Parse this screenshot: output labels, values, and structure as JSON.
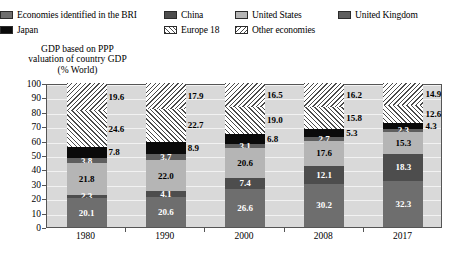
{
  "legend": {
    "rows": [
      [
        {
          "label": "Economies identified in the BRI",
          "key": "bri"
        },
        {
          "label": "China",
          "key": "china"
        },
        {
          "label": "United States",
          "key": "us"
        },
        {
          "label": "United Kingdom",
          "key": "uk"
        }
      ],
      [
        {
          "label": "Japan",
          "key": "japan"
        },
        {
          "label": "Europe 18",
          "key": "eu18"
        },
        {
          "label": "Other economies",
          "key": "other"
        }
      ]
    ]
  },
  "axis_title": {
    "line1": "GDP based on PPP",
    "line2": "valuation of country GDP",
    "line3": "(% World)"
  },
  "chart_data": {
    "type": "bar",
    "title": "GDP based on PPP valuation of country GDP (% World)",
    "xlabel": "",
    "ylabel": "% World",
    "ylim": [
      0,
      100
    ],
    "yticks": [
      0,
      10,
      20,
      30,
      40,
      50,
      60,
      70,
      80,
      90,
      100
    ],
    "grid": true,
    "stacked": true,
    "legend_position": "top",
    "categories": [
      "1980",
      "1990",
      "2000",
      "2008",
      "2017"
    ],
    "series": [
      {
        "name": "Economies identified in the BRI",
        "key": "bri",
        "color": "#6e6e6e",
        "values": [
          20.1,
          20.6,
          26.6,
          30.2,
          32.3
        ]
      },
      {
        "name": "China",
        "key": "china",
        "color": "#4d4d4d",
        "values": [
          2.3,
          4.1,
          7.4,
          12.1,
          18.3
        ]
      },
      {
        "name": "United States",
        "key": "us",
        "color": "#b5b5b5",
        "values": [
          21.8,
          22.0,
          20.6,
          17.6,
          15.3
        ]
      },
      {
        "name": "United Kingdom",
        "key": "uk",
        "color": "#5e5e5e",
        "values": [
          3.8,
          3.7,
          3.1,
          2.7,
          2.3
        ]
      },
      {
        "name": "Japan",
        "key": "japan",
        "color": "#0a0a0a",
        "values": [
          7.8,
          8.9,
          6.8,
          5.3,
          4.3
        ]
      },
      {
        "name": "Europe 18",
        "key": "eu18",
        "color": "hatch-45",
        "values": [
          24.6,
          22.7,
          19.0,
          15.8,
          12.6
        ]
      },
      {
        "name": "Other economies",
        "key": "other",
        "color": "hatch-135",
        "values": [
          19.6,
          17.9,
          16.5,
          16.2,
          14.9
        ]
      }
    ]
  }
}
